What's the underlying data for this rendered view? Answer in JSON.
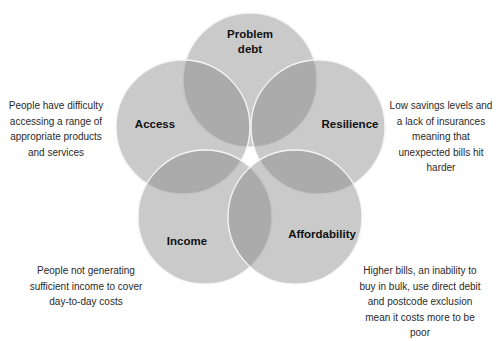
{
  "diagram": {
    "type": "venn",
    "circle_count": 5,
    "colors": {
      "circle_fill": "#808080",
      "circle_fill_opacity": 0.42,
      "circle_stroke": "#f4f4f4",
      "label_text": "#111111",
      "description_text": "#2a2a2a",
      "background": "#ffffff"
    },
    "circles": [
      {
        "id": "problem-debt",
        "label": "Problem\ndebt",
        "cx": 250,
        "cy": 80,
        "r": 67,
        "label_x": 250,
        "label_y": 42
      },
      {
        "id": "access",
        "label": "Access",
        "cx": 183,
        "cy": 127,
        "r": 67,
        "label_x": 155,
        "label_y": 124
      },
      {
        "id": "resilience",
        "label": "Resilience",
        "cx": 318,
        "cy": 127,
        "r": 67,
        "label_x": 350,
        "label_y": 124
      },
      {
        "id": "income",
        "label": "Income",
        "cx": 205,
        "cy": 217,
        "r": 67,
        "label_x": 187,
        "label_y": 241
      },
      {
        "id": "affordability",
        "label": "Affordability",
        "cx": 295,
        "cy": 217,
        "r": 67,
        "label_x": 322,
        "label_y": 234
      }
    ],
    "descriptions": {
      "access": "People have difficulty accessing a range of appropriate products and services",
      "resilience": "Low savings levels and a lack of insurances meaning that unexpected bills hit harder",
      "income": "People not generating sufficient income to cover day-to-day costs",
      "affordability": "Higher bills, an inability to buy in bulk, use direct debit and postcode exclusion mean it costs more to be poor"
    }
  }
}
